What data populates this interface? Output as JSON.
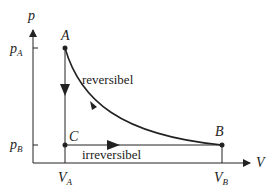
{
  "diagram": {
    "type": "p-V diagram",
    "axes": {
      "y_label": "p",
      "x_label": "V",
      "y_ticks": [
        {
          "main": "p",
          "sub": "A"
        },
        {
          "main": "p",
          "sub": "B"
        }
      ],
      "x_ticks": [
        {
          "main": "V",
          "sub": "A"
        },
        {
          "main": "V",
          "sub": "B"
        }
      ]
    },
    "points": {
      "A": "A",
      "B": "B",
      "C": "C"
    },
    "paths": {
      "reversible_label": "reversibel",
      "irreversible_label": "irreversibel"
    },
    "colors": {
      "line": "#222222",
      "background": "#ffffff"
    }
  }
}
